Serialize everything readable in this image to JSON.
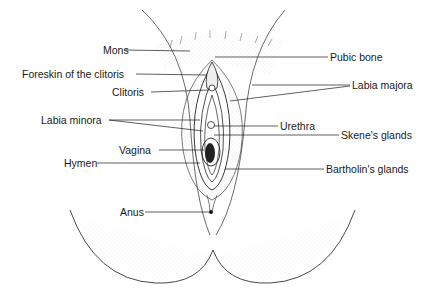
{
  "diagram": {
    "type": "anatomical line drawing",
    "labels_left": [
      {
        "text": "Mons",
        "x": 103,
        "y": 44
      },
      {
        "text": "Foreskin of the clitoris",
        "x": 22,
        "y": 68
      },
      {
        "text": "Clitoris",
        "x": 112,
        "y": 86
      },
      {
        "text": "Labia minora",
        "x": 41,
        "y": 114
      },
      {
        "text": "Vagina",
        "x": 119,
        "y": 144
      },
      {
        "text": "Hymen",
        "x": 64,
        "y": 157
      },
      {
        "text": "Anus",
        "x": 120,
        "y": 205
      }
    ],
    "labels_right": [
      {
        "text": "Pubic bone",
        "x": 330,
        "y": 51
      },
      {
        "text": "Labia majora",
        "x": 352,
        "y": 79
      },
      {
        "text": "Urethra",
        "x": 280,
        "y": 120
      },
      {
        "text": "Skene's glands",
        "x": 341,
        "y": 129
      },
      {
        "text": "Bartholin's glands",
        "x": 326,
        "y": 163
      }
    ]
  }
}
